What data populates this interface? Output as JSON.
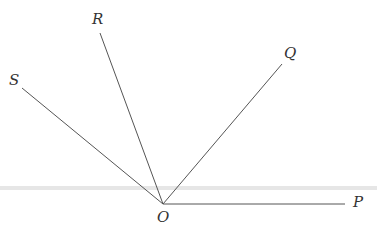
{
  "diagram": {
    "type": "rays from a common vertex",
    "vertex": {
      "label": "O",
      "x": 163,
      "y": 204,
      "label_x": 157,
      "label_y": 210
    },
    "rays": [
      {
        "name": "ray-op",
        "label": "P",
        "x2": 345,
        "y2": 204,
        "label_x": 353,
        "label_y": 195
      },
      {
        "name": "ray-oq",
        "label": "Q",
        "x2": 282,
        "y2": 64,
        "label_x": 284,
        "label_y": 46
      },
      {
        "name": "ray-or",
        "label": "R",
        "x2": 100,
        "y2": 33,
        "label_x": 92,
        "label_y": 12
      },
      {
        "name": "ray-os",
        "label": "S",
        "x2": 22,
        "y2": 88,
        "label_x": 9,
        "label_y": 73
      }
    ],
    "band": {
      "y": 188,
      "color": "#e6e6e6"
    },
    "line_color": "#555555"
  }
}
